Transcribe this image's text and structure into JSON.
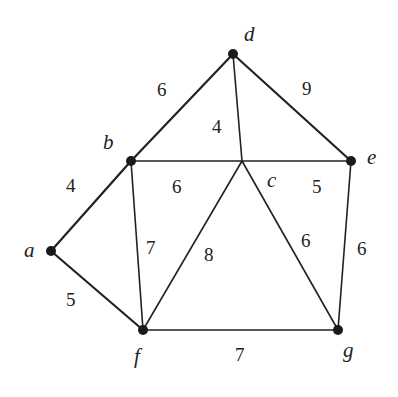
{
  "diagram": {
    "type": "weighted-undirected-graph",
    "vertices": [
      {
        "id": "a",
        "label": "a",
        "x": 51,
        "y": 251,
        "dot": true,
        "lx": 24,
        "ly": 257
      },
      {
        "id": "b",
        "label": "b",
        "x": 131,
        "y": 161,
        "dot": true,
        "lx": 103,
        "ly": 149
      },
      {
        "id": "c",
        "label": "c",
        "x": 242,
        "y": 161,
        "dot": false,
        "lx": 267,
        "ly": 187
      },
      {
        "id": "d",
        "label": "d",
        "x": 233,
        "y": 54,
        "dot": true,
        "lx": 244,
        "ly": 41
      },
      {
        "id": "e",
        "label": "e",
        "x": 351,
        "y": 161,
        "dot": true,
        "lx": 367,
        "ly": 164
      },
      {
        "id": "f",
        "label": "f",
        "x": 143,
        "y": 330,
        "dot": true,
        "lx": 134,
        "ly": 363
      },
      {
        "id": "g",
        "label": "g",
        "x": 338,
        "y": 330,
        "dot": true,
        "lx": 343,
        "ly": 357
      }
    ],
    "edges": [
      {
        "from": "a",
        "to": "b",
        "weight": "4",
        "wx": 66,
        "wy": 192,
        "thick": true
      },
      {
        "from": "a",
        "to": "f",
        "weight": "5",
        "wx": 66,
        "wy": 306,
        "thick": true
      },
      {
        "from": "b",
        "to": "d",
        "weight": "6",
        "wx": 157,
        "wy": 96,
        "thick": true
      },
      {
        "from": "b",
        "to": "c",
        "weight": "6",
        "wx": 172,
        "wy": 193,
        "thick": false
      },
      {
        "from": "b",
        "to": "f",
        "weight": "7",
        "wx": 146,
        "wy": 254,
        "thick": false
      },
      {
        "from": "d",
        "to": "c",
        "weight": "4",
        "wx": 212,
        "wy": 133,
        "thick": false
      },
      {
        "from": "d",
        "to": "e",
        "weight": "9",
        "wx": 302,
        "wy": 95,
        "thick": true
      },
      {
        "from": "c",
        "to": "e",
        "weight": "5",
        "wx": 312,
        "wy": 193,
        "thick": false
      },
      {
        "from": "c",
        "to": "f",
        "weight": "8",
        "wx": 204,
        "wy": 261,
        "thick": false
      },
      {
        "from": "c",
        "to": "g",
        "weight": "6",
        "wx": 301,
        "wy": 247,
        "thick": false
      },
      {
        "from": "e",
        "to": "g",
        "weight": "6",
        "wx": 357,
        "wy": 255,
        "thick": false
      },
      {
        "from": "f",
        "to": "g",
        "weight": "7",
        "wx": 235,
        "wy": 361,
        "thick": false
      }
    ]
  },
  "colors": {
    "line": "#222222",
    "node": "#1a1a1a",
    "background": "#ffffff"
  }
}
